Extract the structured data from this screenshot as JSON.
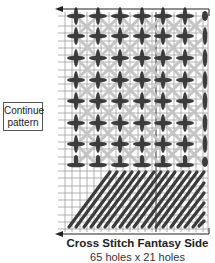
{
  "note": {
    "line1": "Continue",
    "line2": "pattern"
  },
  "caption": {
    "title": "Cross Stitch Fantasy Side",
    "dimensions": "65 holes x 21 holes"
  },
  "colors": {
    "grid": "#9a9a9a",
    "stitch_dark": "#3c3c3c",
    "stitch_light": "#c4c4c4",
    "arrow": "#222222"
  },
  "diagram": {
    "type": "needlepoint stitch chart",
    "cross_columns": 7,
    "cross_rows": 8,
    "diagonal_rows": 5,
    "arrows": [
      "top-left-pointing",
      "bottom-left-pointing"
    ]
  }
}
